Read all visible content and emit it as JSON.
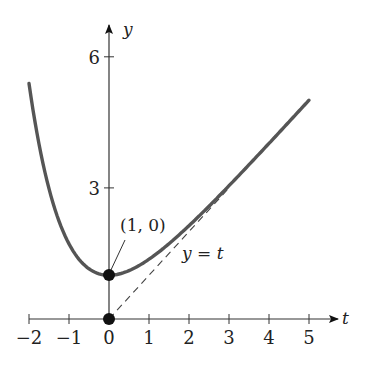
{
  "chart_data": {
    "type": "line",
    "title": "",
    "xlabel": "t",
    "ylabel": "y",
    "xlim": [
      -2,
      5.6
    ],
    "ylim": [
      0,
      6.6
    ],
    "x_ticks": [
      -2,
      -1,
      0,
      1,
      2,
      3,
      4,
      5
    ],
    "x_tick_labels": [
      "−2",
      "−1",
      "0",
      "1",
      "2",
      "3",
      "4",
      "5"
    ],
    "y_ticks": [
      3,
      6
    ],
    "y_tick_labels": [
      "3",
      "6"
    ],
    "grid": false,
    "legend": null,
    "series": [
      {
        "name": "curve",
        "style": "solid",
        "color": "#555555",
        "x": [
          -2,
          -1.5,
          -1,
          -0.5,
          0,
          0.5,
          1,
          1.5,
          2,
          2.5,
          3,
          3.5,
          4,
          4.5,
          5
        ],
        "values": [
          5.39,
          2.98,
          1.72,
          1.15,
          1.0,
          1.11,
          1.37,
          1.72,
          2.14,
          2.58,
          3.05,
          3.53,
          4.02,
          4.51,
          5.01
        ]
      },
      {
        "name": "y = t",
        "style": "dashed",
        "color": "#555555",
        "x": [
          0,
          3
        ],
        "values": [
          0,
          3
        ]
      }
    ],
    "points": [
      {
        "x": 0,
        "y": 1,
        "label": "(1, 0)"
      },
      {
        "x": 0,
        "y": 0,
        "label": ""
      }
    ],
    "annotations": [
      {
        "text": "(1, 0)",
        "points_to": [
          0,
          1
        ]
      },
      {
        "text": "y = t",
        "near": [
          2,
          1.7
        ]
      }
    ]
  },
  "labels": {
    "y_axis": "y",
    "t_axis": "t",
    "point_label": "(1, 0)",
    "asymptote_label_var": "y",
    "asymptote_label_eq": " = ",
    "asymptote_label_t": "t"
  }
}
